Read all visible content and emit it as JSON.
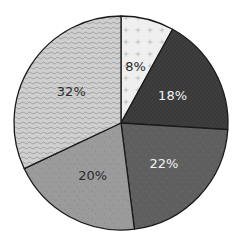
{
  "chart_data": {
    "type": "pie",
    "title": "",
    "legend": "none",
    "start_angle_deg": 0,
    "direction": "clockwise",
    "slices": [
      {
        "label": "8%",
        "value": 8,
        "fill": "#efefef",
        "pattern": "plus",
        "pattern_color": "#b5b5b5",
        "text_color": "#2a2a2a"
      },
      {
        "label": "18%",
        "value": 18,
        "fill": "#3a3a3a",
        "pattern": "fine",
        "pattern_color": "#474747",
        "text_color": "#f2f2f2"
      },
      {
        "label": "22%",
        "value": 22,
        "fill": "#5f5f5f",
        "pattern": "speck",
        "pattern_color": "#6c6c6c",
        "text_color": "#f2f2f2"
      },
      {
        "label": "20%",
        "value": 20,
        "fill": "#9b9b9b",
        "pattern": "speck",
        "pattern_color": "#8a8a8a",
        "text_color": "#2a2a2a"
      },
      {
        "label": "32%",
        "value": 32,
        "fill": "#cfcfcf",
        "pattern": "wave",
        "pattern_color": "#9a9a9a",
        "text_color": "#2a2a2a"
      }
    ]
  },
  "geometry": {
    "cx": 121,
    "cy": 123,
    "r": 107,
    "label_radius_frac": 0.55
  }
}
